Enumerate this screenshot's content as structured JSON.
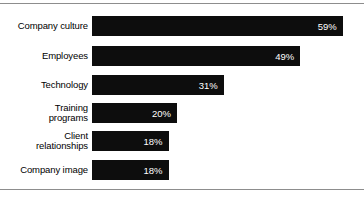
{
  "chart_data": {
    "type": "bar",
    "orientation": "horizontal",
    "title": "",
    "subtitle": "",
    "xlabel": "",
    "ylabel": "",
    "xlim": [
      0,
      64
    ],
    "grid": false,
    "legend": null,
    "categories": [
      "Company culture",
      "Employees",
      "Technology",
      "Training\nprograms",
      "Client\nrelationships",
      "Company image"
    ],
    "values": [
      59,
      49,
      31,
      20,
      18,
      18
    ],
    "value_labels": [
      "59%",
      "49%",
      "31%",
      "20%",
      "18%",
      "18%"
    ],
    "colors": {
      "bar": "#0d0d0d",
      "bar_label_text": "#ffffff",
      "category_label_text": "#000000",
      "background": "#ffffff",
      "rule": "#8d8d8d"
    }
  },
  "figure": {
    "top_rule": "horizontal-rule",
    "bottom_rule": "horizontal-rule"
  }
}
